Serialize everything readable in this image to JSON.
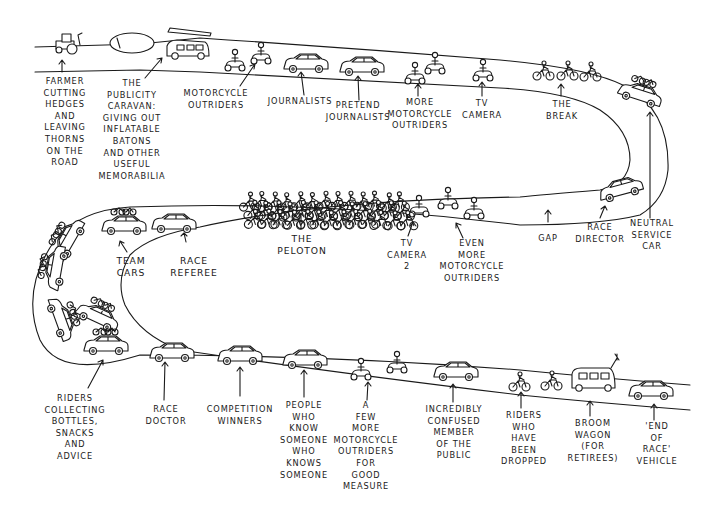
{
  "colors": {
    "ink": "#1a1a1a",
    "paper": "#ffffff"
  },
  "labels": {
    "farmer": "Farmer\ncutting\nhedges\nand\nleaving\nthorns\non the\nroad",
    "caravan": "The\npublicity\ncaravan:\ngiving out\ninflatable\nbatons\nand other\nuseful\nmemorabilia",
    "moto1": "Motorcycle\noutriders",
    "journalists": "Journalists",
    "pretend": "Pretend\njournalists",
    "moto2": "More\nmotorcycle\noutriders",
    "tvcamera": "TV\ncamera",
    "break": "The\nbreak",
    "neutral": "Neutral\nservice\ncar",
    "director": "Race\ndirector",
    "gap": "Gap",
    "moto3": "Even\nmore\nmotorcycle\noutriders",
    "tvcamera2": "TV\ncamera\n2",
    "peloton": "The\npeloton",
    "referee": "Race\nreferee",
    "teamcars": "Team\ncars",
    "riders_collect": "Riders\ncollecting\nbottles,\nsnacks\nand\nadvice",
    "doctor": "Race\ndoctor",
    "competition": "Competition\nwinners",
    "people": "People\nwho\nknow\nsomeone\nwho\nknows\nsomeone",
    "moto4": "A\nfew\nmore\nmotorcycle\noutriders\nfor\ngood\nmeasure",
    "confused": "Incredibly\nconfused\nmember\nof the\npublic",
    "dropped": "Riders\nwho\nhave\nbeen\ndropped",
    "broom": "Broom\nwagon\n(for\nretirees)",
    "endofrace": "'End\nof\nrace'\nvehicle"
  }
}
